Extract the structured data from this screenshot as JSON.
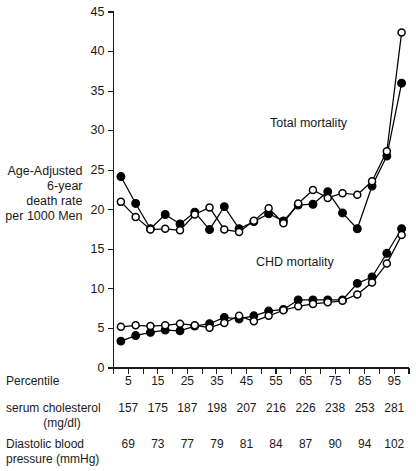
{
  "figure": {
    "background": "#ffffff",
    "ink": "#000000"
  },
  "axis": {
    "y_label_lines": [
      "Age-Adjusted",
      "6-year",
      "death rate",
      "per 1000 Men"
    ],
    "y_ticks": [
      0,
      5,
      10,
      15,
      20,
      25,
      30,
      35,
      40,
      45
    ],
    "y_tick_labels": [
      "0",
      "5",
      "10",
      "15",
      "20",
      "25",
      "30",
      "35",
      "40",
      "45"
    ],
    "x_tick_labels": [
      "5",
      "15",
      "25",
      "35",
      "45",
      "55",
      "65",
      "75",
      "85",
      "95"
    ]
  },
  "annotations": [
    {
      "name": "total-mortality",
      "text": "Total mortality",
      "x": 270,
      "y": 127
    },
    {
      "name": "chd-mortality",
      "text": "CHD mortality",
      "x": 256,
      "y": 266
    }
  ],
  "bottom_rows": [
    {
      "name": "percentile",
      "label_lines": [
        "Percentile"
      ],
      "values": [
        "5",
        "15",
        "25",
        "35",
        "45",
        "55",
        "65",
        "75",
        "85",
        "95"
      ]
    },
    {
      "name": "serum-cholesterol",
      "label_lines": [
        "serum cholesterol",
        "(mg/dl)"
      ],
      "values": [
        "157",
        "175",
        "187",
        "198",
        "207",
        "216",
        "226",
        "238",
        "253",
        "281"
      ]
    },
    {
      "name": "diastolic-blood-pressure",
      "label_lines": [
        "Diastolic blood",
        "pressure (mmHg)"
      ],
      "values": [
        "69",
        "73",
        "77",
        "79",
        "81",
        "84",
        "87",
        "90",
        "94",
        "102"
      ]
    }
  ],
  "chart_data": {
    "type": "line",
    "title": "",
    "xlabel": "",
    "ylabel": "Age-Adjusted 6-year death rate per 1000 Men",
    "ylim": [
      0,
      45
    ],
    "grid": false,
    "legend": "inline-annotations",
    "x": [
      1,
      2,
      3,
      4,
      5,
      6,
      7,
      8,
      9,
      10,
      11,
      12,
      13,
      14,
      15,
      16,
      17,
      18,
      19,
      20
    ],
    "x_percentiles": [
      2.5,
      7.5,
      12.5,
      17.5,
      22.5,
      27.5,
      32.5,
      37.5,
      42.5,
      47.5,
      52.5,
      57.5,
      62.5,
      67.5,
      72.5,
      77.5,
      82.5,
      87.5,
      92.5,
      97.5
    ],
    "series": [
      {
        "name": "Total mortality - serum cholesterol",
        "marker": "filled-circle",
        "values": [
          24.2,
          20.8,
          17.6,
          19.4,
          18.2,
          19.7,
          17.5,
          20.4,
          17.6,
          18.5,
          19.5,
          18.6,
          20.6,
          20.7,
          22.3,
          19.6,
          17.6,
          23.0,
          26.8,
          36.0
        ]
      },
      {
        "name": "Total mortality - diastolic blood pressure",
        "marker": "open-circle",
        "values": [
          21.0,
          19.1,
          17.5,
          17.6,
          17.4,
          19.4,
          20.3,
          17.5,
          17.2,
          18.6,
          20.2,
          18.3,
          20.8,
          22.5,
          21.5,
          22.1,
          21.9,
          23.6,
          27.4,
          42.4
        ]
      },
      {
        "name": "CHD mortality - serum cholesterol",
        "marker": "filled-circle",
        "values": [
          3.4,
          4.1,
          4.5,
          4.8,
          4.7,
          5.3,
          5.6,
          6.4,
          6.2,
          6.6,
          7.2,
          7.4,
          8.6,
          8.6,
          8.6,
          8.6,
          10.7,
          11.5,
          14.5,
          17.6
        ]
      },
      {
        "name": "CHD mortality - diastolic blood pressure",
        "marker": "open-circle",
        "values": [
          5.2,
          5.4,
          5.3,
          5.4,
          5.6,
          5.4,
          5.1,
          5.7,
          6.6,
          5.9,
          6.6,
          7.3,
          7.8,
          8.1,
          8.3,
          8.5,
          9.3,
          10.8,
          13.2,
          16.8
        ]
      }
    ]
  }
}
